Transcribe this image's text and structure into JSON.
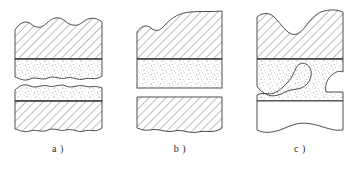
{
  "figure": {
    "background_color": "#ffffff",
    "line_color": "#3a3a3a",
    "hatch_color": "#6e6e6e",
    "stipple_color": "#555555",
    "panel_count": 3
  },
  "panels": [
    {
      "id": "a",
      "caption": "a )",
      "caption_x": 58,
      "caption_y": 152,
      "description": "Upper hatched block with wavy top edge over a stippled layer having a wavy lower edge; gap; lower stippled layer with wavy upper edge over a hatched block with wavy bottom edge.",
      "parts": [
        {
          "name": "upper-hatched-block",
          "fill": "hatch"
        },
        {
          "name": "upper-stipple-layer",
          "fill": "stipple"
        },
        {
          "name": "separation-gap",
          "fill": "none"
        },
        {
          "name": "lower-stipple-layer",
          "fill": "stipple"
        },
        {
          "name": "lower-hatched-block",
          "fill": "hatch"
        }
      ]
    },
    {
      "id": "b",
      "caption": "b )",
      "caption_x": 180,
      "caption_y": 152,
      "description": "Upper hatched block with irregular rising top edge over a stippled layer with straight horizontal bottom; gap; lower hatched block with wavy bottom edge.",
      "parts": [
        {
          "name": "upper-hatched-block",
          "fill": "hatch"
        },
        {
          "name": "upper-stipple-layer",
          "fill": "stipple"
        },
        {
          "name": "separation-gap",
          "fill": "none"
        },
        {
          "name": "lower-hatched-block",
          "fill": "hatch"
        }
      ]
    },
    {
      "id": "c",
      "caption": "c )",
      "caption_x": 300,
      "caption_y": 152,
      "description": "Upper hatched block with a notch in its top edge over a stippled zone split by an S-shaped white channel; below, a plain unhatched block with a wavy bottom edge.",
      "parts": [
        {
          "name": "upper-hatched-block",
          "fill": "hatch"
        },
        {
          "name": "stipple-zone-upper",
          "fill": "stipple"
        },
        {
          "name": "s-channel",
          "fill": "none"
        },
        {
          "name": "stipple-zone-lower",
          "fill": "stipple"
        },
        {
          "name": "lower-plain-block",
          "fill": "none"
        }
      ]
    }
  ]
}
